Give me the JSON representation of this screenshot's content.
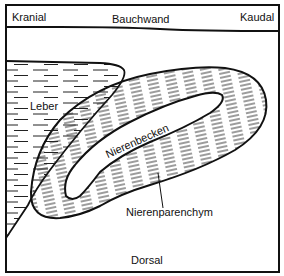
{
  "diagram": {
    "type": "anatomical-schematic",
    "labels": {
      "top_left": "Kranial",
      "top_center": "Bauchwand",
      "top_right": "Kaudal",
      "liver": "Leber",
      "pelvis": "Nierenbecken",
      "parenchyma": "Nierenparenchym",
      "bottom": "Dorsal"
    },
    "colors": {
      "stroke": "#111111",
      "background": "#ffffff"
    }
  }
}
